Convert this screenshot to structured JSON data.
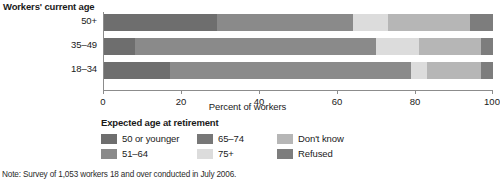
{
  "chart_data": {
    "type": "bar",
    "orientation": "horizontal",
    "stacked": true,
    "title": "",
    "ylabel": "Workers' current age",
    "xlabel": "Percent of workers",
    "xlim": [
      0,
      100
    ],
    "xticks": [
      0,
      20,
      40,
      60,
      80,
      100
    ],
    "xtick_labels": [
      "0",
      "20",
      "40",
      "60",
      "80",
      "100"
    ],
    "grid": false,
    "legend_title": "Expected age at retirement",
    "legend_position": "below",
    "categories": [
      "50+",
      "35–49",
      "18–34"
    ],
    "series": [
      {
        "name": "50 or younger",
        "color": "#6e6e6e",
        "values": [
          29,
          8,
          17
        ]
      },
      {
        "name": "51–64",
        "color": "#8a8a8a",
        "values": [
          35,
          62,
          62
        ]
      },
      {
        "name": "65–74",
        "color": "#777777",
        "values": [
          0,
          0,
          0
        ]
      },
      {
        "name": "75+",
        "color": "#dcdcdc",
        "values": [
          9,
          11,
          4
        ]
      },
      {
        "name": "Don't know",
        "color": "#b6b6b6",
        "values": [
          21,
          16,
          14
        ]
      },
      {
        "name": "Refused",
        "color": "#7d7d7d",
        "values": [
          6,
          3,
          3
        ]
      }
    ],
    "note": "Note: Survey of 1,053 workers 18 and over conducted in July 2006."
  },
  "axis": {
    "y_title": "Workers' current age",
    "x_title": "Percent of workers"
  },
  "legend": {
    "title": "Expected age at retirement",
    "items": [
      {
        "label": "50 or younger",
        "color": "#6e6e6e"
      },
      {
        "label": "65–74",
        "color": "#777777"
      },
      {
        "label": "Don't know",
        "color": "#b6b6b6"
      },
      {
        "label": "51–64",
        "color": "#8a8a8a"
      },
      {
        "label": "75+",
        "color": "#dcdcdc"
      },
      {
        "label": "Refused",
        "color": "#7d7d7d"
      }
    ]
  },
  "footer": {
    "note": "Note: Survey of 1,053 workers 18 and over conducted in July 2006."
  }
}
